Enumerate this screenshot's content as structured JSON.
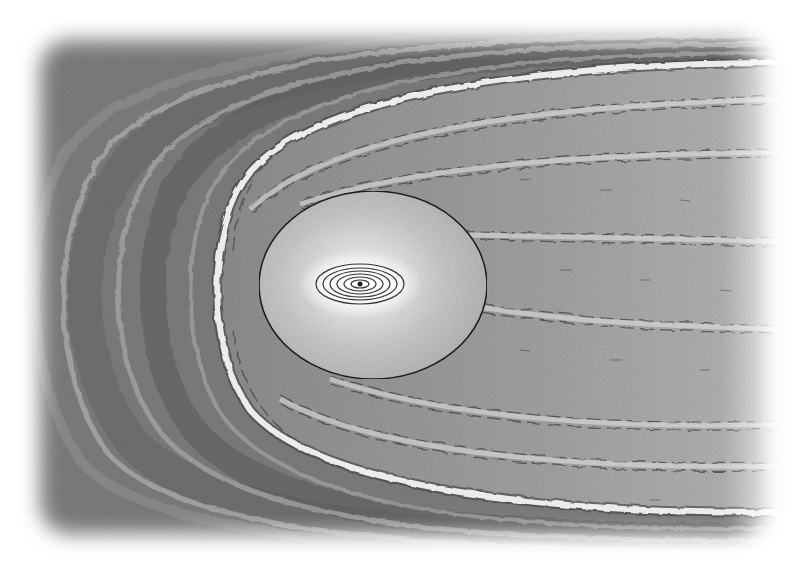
{
  "image": {
    "alt": "Pencil illustration of a star inside an oval astrosphere bubble surrounded by a curved bow shock and streaming tail",
    "style": "graphite pencil sketch, grayscale",
    "colors": {
      "background": "#ffffff",
      "outer_field": "#7a7a7a",
      "outer_band_dark": "#5e5e5e",
      "tail_field": "#9a9a9a",
      "bubble_fill": "#c4c4c4",
      "bubble_outline": "#1e1e1e",
      "bow_shock": "#e8e8e8",
      "core_glow": "#f4f4f4",
      "ring_stroke": "#333333"
    },
    "elements": {
      "star_core": {
        "cx": 360,
        "cy": 283,
        "rings": 6
      },
      "bubble": {
        "cx": 373,
        "cy": 285,
        "rx": 114,
        "ry": 94
      },
      "bow_shock": {
        "apex_x": 212,
        "apex_y": 290,
        "top_end_y": 62,
        "bottom_end_y": 512
      },
      "outer_bands": 4,
      "tail_streams": 7
    }
  }
}
